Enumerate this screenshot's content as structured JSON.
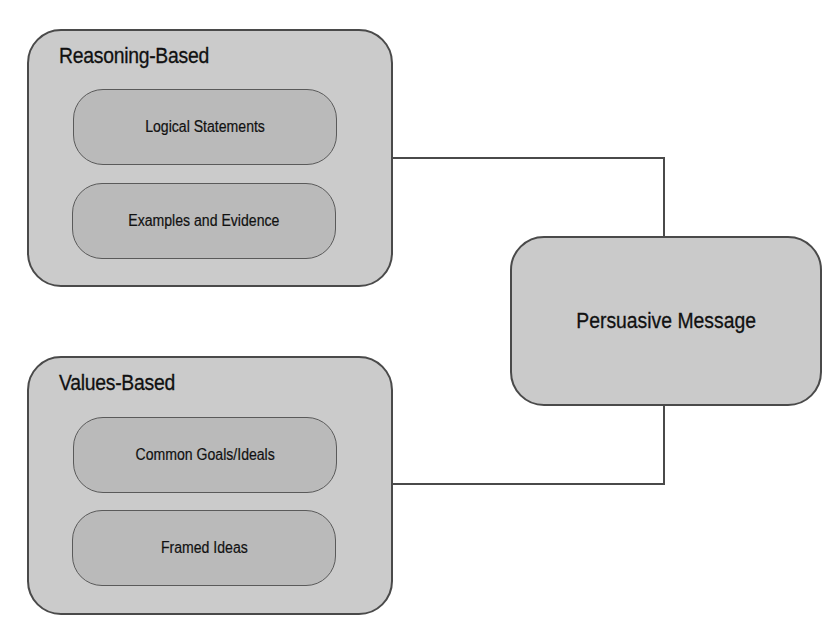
{
  "diagram": {
    "groups": [
      {
        "title": "Reasoning-Based",
        "items": [
          {
            "label": "Logical Statements"
          },
          {
            "label": "Examples and Evidence"
          }
        ]
      },
      {
        "title": "Values-Based",
        "items": [
          {
            "label": "Common Goals/Ideals"
          },
          {
            "label": "Framed Ideas"
          }
        ]
      }
    ],
    "target": {
      "label": "Persuasive Message"
    },
    "connections": [
      {
        "from": "Reasoning-Based",
        "to": "Persuasive Message"
      },
      {
        "from": "Values-Based",
        "to": "Persuasive Message"
      }
    ],
    "colors": {
      "group_fill": "#cbcbcb",
      "item_fill": "#bababa",
      "stroke": "#4a4a4a",
      "background": "#ffffff"
    }
  }
}
